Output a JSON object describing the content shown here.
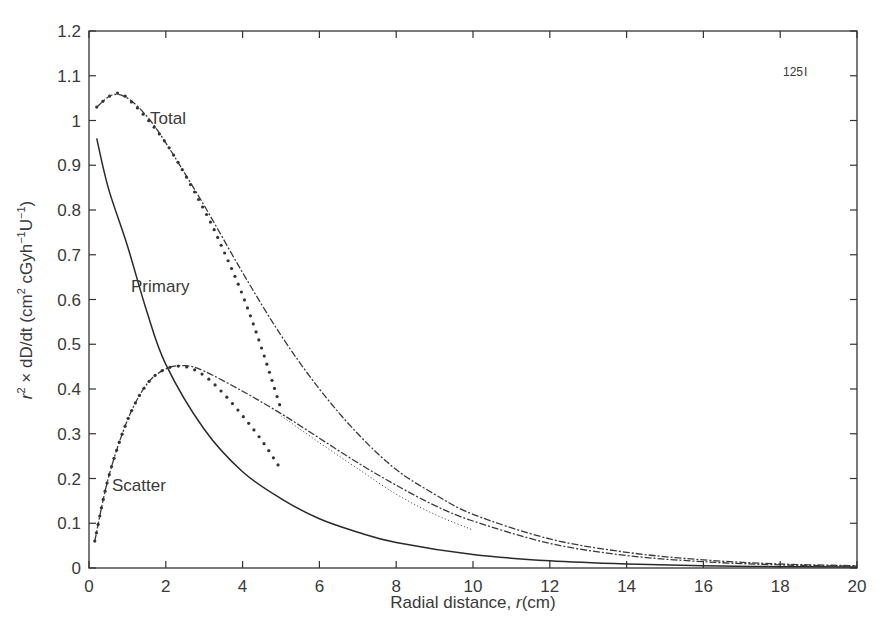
{
  "chart_data": {
    "type": "line",
    "title": "",
    "xlabel": "Radial distance, r(cm)",
    "ylabel": "r² × dD/dt (cm² cGyh⁻¹U⁻¹)",
    "xlim": [
      0,
      20
    ],
    "ylim": [
      0,
      1.2
    ],
    "grid": false,
    "legend": "none (inline curve labels)",
    "x_ticks": [
      "0",
      "2",
      "4",
      "6",
      "8",
      "10",
      "12",
      "14",
      "16",
      "18",
      "20"
    ],
    "y_ticks": [
      "0",
      "0.1",
      "0.2",
      "0.3",
      "0.4",
      "0.5",
      "0.6",
      "0.7",
      "0.8",
      "0.9",
      "1",
      "1.1",
      "1.2"
    ],
    "annotations": [
      {
        "text": "Total",
        "x": 2.3,
        "y": 1.01
      },
      {
        "text": "Primary",
        "x": 1.55,
        "y": 0.63
      },
      {
        "text": "Scatter",
        "x": 0.6,
        "y": 0.17
      },
      {
        "text": "125I",
        "x": 18.3,
        "y": 1.13
      }
    ],
    "series": [
      {
        "name": "Total",
        "style": "dashed-dotted",
        "x": [
          0.2,
          0.6,
          1,
          1.5,
          2,
          3,
          4,
          5,
          6,
          7,
          8,
          9,
          10,
          12,
          14,
          16,
          18,
          20
        ],
        "values": [
          1.03,
          1.057,
          1.05,
          1.01,
          0.95,
          0.81,
          0.66,
          0.52,
          0.4,
          0.3,
          0.22,
          0.165,
          0.12,
          0.065,
          0.035,
          0.018,
          0.009,
          0.005
        ]
      },
      {
        "name": "Total (short range)",
        "style": "dots",
        "x": [
          0.2,
          0.6,
          1,
          2,
          3,
          3.5,
          4,
          4.5,
          5
        ],
        "values": [
          1.03,
          1.057,
          1.05,
          0.95,
          0.8,
          0.71,
          0.61,
          0.49,
          0.355
        ]
      },
      {
        "name": "Primary",
        "style": "solid",
        "x": [
          0.2,
          0.5,
          1,
          1.5,
          2,
          3,
          4,
          5,
          6,
          7,
          8,
          10,
          12,
          14,
          16,
          18,
          20
        ],
        "values": [
          0.96,
          0.85,
          0.72,
          0.575,
          0.455,
          0.31,
          0.215,
          0.155,
          0.11,
          0.08,
          0.057,
          0.03,
          0.016,
          0.009,
          0.005,
          0.003,
          0.002
        ]
      },
      {
        "name": "Scatter",
        "style": "dashed-dotted",
        "x": [
          0.15,
          0.5,
          1,
          1.5,
          2,
          2.5,
          3,
          4,
          5,
          6,
          7,
          8,
          9,
          10,
          12,
          14,
          16,
          18,
          20
        ],
        "values": [
          0.06,
          0.2,
          0.33,
          0.41,
          0.445,
          0.452,
          0.44,
          0.395,
          0.345,
          0.29,
          0.235,
          0.185,
          0.14,
          0.105,
          0.055,
          0.028,
          0.014,
          0.007,
          0.004
        ]
      },
      {
        "name": "Scatter (short range, 5 cm)",
        "style": "dots",
        "x": [
          0.15,
          0.5,
          1,
          1.5,
          2,
          2.5,
          3,
          3.5,
          4,
          4.5,
          5
        ],
        "values": [
          0.06,
          0.2,
          0.33,
          0.41,
          0.445,
          0.45,
          0.43,
          0.39,
          0.34,
          0.285,
          0.22
        ]
      },
      {
        "name": "Scatter (short range, 10 cm)",
        "style": "fine-dots",
        "x": [
          5,
          6,
          7,
          8,
          9,
          10
        ],
        "values": [
          0.34,
          0.28,
          0.222,
          0.165,
          0.12,
          0.085
        ]
      }
    ]
  },
  "axes": {
    "x_label_main": "Radial distance, ",
    "x_label_var": "r",
    "x_label_unit": "(cm)",
    "y_label_pre": "r",
    "y_label_rest": " × dD/dt (cm",
    "y_label_units": " cGyh",
    "y_label_tail": "U",
    "y_label_close": ")",
    "sup2": "2",
    "supm1": "−1"
  },
  "labels": {
    "total": "Total",
    "primary": "Primary",
    "scatter": "Scatter",
    "isotope_mass": "125",
    "isotope_symbol": "I"
  }
}
